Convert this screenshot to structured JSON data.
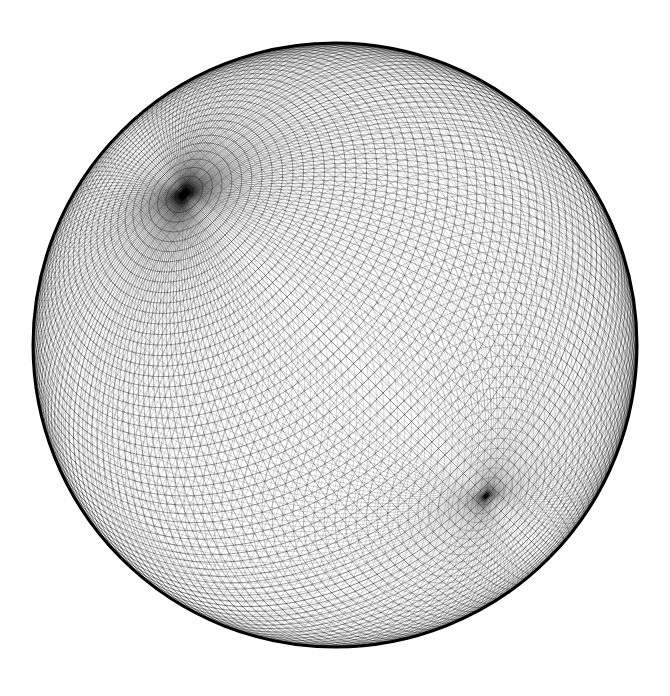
{
  "figure": {
    "background_color": "#ffffff",
    "line_color": "#000000",
    "mesh": {
      "latitude_rings": 90,
      "longitude_segments": 180,
      "triangulated": true,
      "pole_axis_tilt_deg": 45,
      "visible_pole_features": [
        "upper-left-pole",
        "lower-right-pole"
      ]
    }
  }
}
